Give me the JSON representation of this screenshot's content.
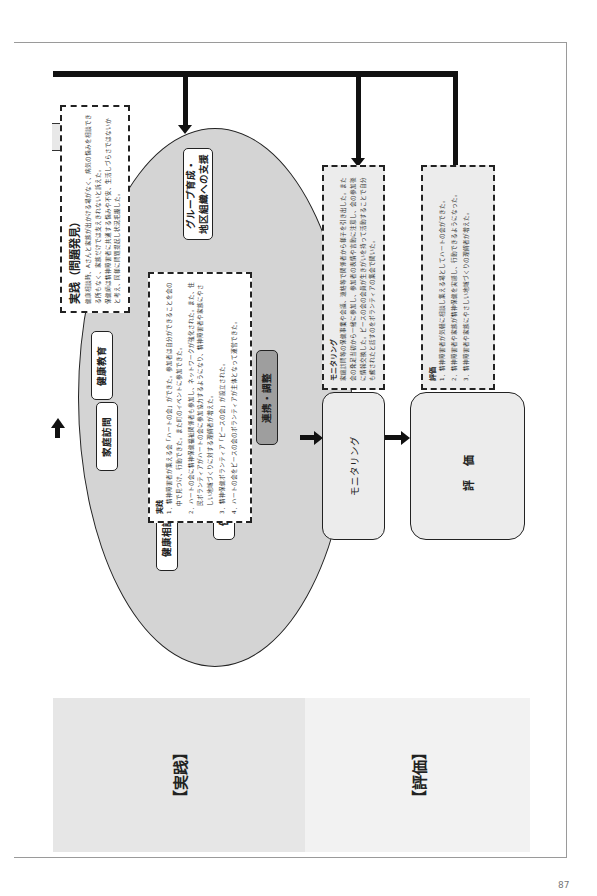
{
  "page": {
    "page_number": "87"
  },
  "bands": {
    "practice_label": "【実践】",
    "evaluation_label": "【評価】"
  },
  "problem_box": {
    "title": "実践（問題発見）",
    "lines": [
      "健康相談時、Aさんと家族が出かける場がなく、病気の悩みを相談できる所もなく、家族だけでは支えきれないと訴えた。",
      "保健師は精神障害者に共通する悩みや不安、生活しづらさではないかと考え、同様に問題提起し状況把握した。"
    ]
  },
  "ellipse": {
    "items": {
      "group_support": "グループ育成・\n地区組織への支援",
      "health_education": "健康教育",
      "home_visit": "家庭訪問",
      "health_consultation": "健康相談",
      "health_checkup": "健康診査",
      "coordination": "連携・調整"
    }
  },
  "practice_box": {
    "title": "実践",
    "items": [
      "1．精神障害者が集える会「ハートの会」ができた。参加者は自分ができることを会の中で見つけ、行動できた。また町のイベントに参加できた。",
      "2．ハートの会に精神保健福祉関係者も参加し、ネットワークが強化された。また、住民ボランティアがハートの会に参加協力するようになり、精神障害者や家族にやさしい地域づくりに対する理解者が増えた。",
      "3．精神保健ボランティア「ピースの会」が設立された。",
      "4．ハートの会をピースの会のボランティアが主体となって運営できた。"
    ]
  },
  "monitoring_box": {
    "title": "モニタリング",
    "text": "家庭訪問等の保健事業や会議、連絡等で関係者から様子を引き出した。また会の発足当初から一緒に参加し、参加者の表情や言動に注意し、会の参加後に情報交換した。ピースの会の会員が生きがいを持って活動することで自分も癒されたと話すのをボランティアの集会で聞いた。"
  },
  "monitoring_node": {
    "label": "モニタリング"
  },
  "evaluation_box": {
    "title": "評価",
    "items": [
      "1．精神障害者が気軽に相談し集える場としてハートの会ができた。",
      "2．精神障害者や家族が精神保健を実感し、行動できるようになった。",
      "3．精神障害者や家族にやさしい地域づくりの理解者が増えた。"
    ]
  },
  "evaluation_node": {
    "label": "評価"
  },
  "colors": {
    "ellipse_fill": "#d4d4d4",
    "practice_band": "#e6e6e6",
    "evaluation_band": "#f2f2f2",
    "coordination_fill": "#9e9e9e",
    "connector": "#111111"
  }
}
